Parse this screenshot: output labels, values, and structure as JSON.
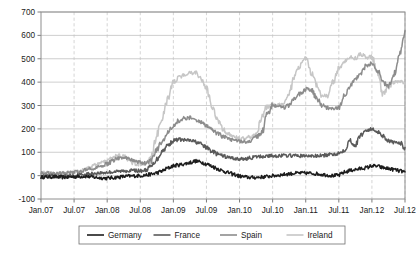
{
  "chart_data": {
    "type": "line",
    "title": "",
    "subtitle": "",
    "xlabel": "",
    "ylabel": "",
    "ylim": [
      -100,
      700
    ],
    "ytick_step": 100,
    "yticks": [
      "700",
      "600",
      "500",
      "400",
      "300",
      "200",
      "100",
      "0",
      "-100"
    ],
    "ytick_values": [
      700,
      600,
      500,
      400,
      300,
      200,
      100,
      0,
      -100
    ],
    "xticks": [
      "Jan.07",
      "Jul.07",
      "Jan.08",
      "Jul.08",
      "Jan.09",
      "Jul.09",
      "Jan.10",
      "Jul.10",
      "Jan.11",
      "Jul.11",
      "Jan.12",
      "Jul.12"
    ],
    "xtick_values": [
      0,
      6,
      12,
      18,
      24,
      30,
      36,
      42,
      48,
      54,
      60,
      66
    ],
    "xlim": [
      0,
      66
    ],
    "x_unit": "months since Jan 2007",
    "grid": {
      "horizontal": true,
      "vertical": true,
      "vertical_style": "dashed"
    },
    "legend": {
      "position": "bottom-center",
      "entries": [
        "Germany",
        "France",
        "Spain",
        "Ireland"
      ]
    },
    "colors": {
      "Germany": "#1d1d1d",
      "France": "#5a5a5a",
      "Spain": "#8c8c8c",
      "Ireland": "#c6c6c6",
      "grid_horizontal": "#b9b9b9",
      "grid_vertical": "#c3c3c3",
      "frame": "#8e8e8e",
      "background": "#ffffff",
      "text": "#1a1a1a"
    },
    "series": [
      {
        "name": "Germany",
        "color": "#1d1d1d",
        "width": 1.5,
        "x": [
          0,
          1,
          2,
          3,
          4,
          5,
          6,
          7,
          8,
          9,
          10,
          11,
          12,
          13,
          14,
          15,
          16,
          17,
          18,
          19,
          20,
          21,
          22,
          23,
          24,
          25,
          26,
          27,
          28,
          29,
          30,
          31,
          32,
          33,
          34,
          35,
          36,
          37,
          38,
          39,
          40,
          41,
          42,
          43,
          44,
          45,
          46,
          47,
          48,
          49,
          50,
          51,
          52,
          53,
          54,
          55,
          56,
          57,
          58,
          59,
          60,
          61,
          62,
          63,
          64,
          65,
          66
        ],
        "values": [
          -6,
          -6,
          -5,
          -6,
          -7,
          -6,
          -5,
          -4,
          -3,
          -5,
          -8,
          -10,
          -11,
          -9,
          -7,
          -4,
          -2,
          -1,
          0,
          2,
          6,
          12,
          20,
          32,
          42,
          46,
          50,
          56,
          62,
          58,
          50,
          40,
          30,
          20,
          12,
          5,
          -2,
          -6,
          -8,
          -8,
          -6,
          -4,
          -1,
          2,
          5,
          8,
          10,
          11,
          11,
          10,
          8,
          5,
          2,
          0,
          2,
          14,
          22,
          26,
          30,
          34,
          42,
          40,
          34,
          30,
          26,
          20,
          16
        ]
      },
      {
        "name": "France",
        "color": "#5a5a5a",
        "width": 1.5,
        "x": [
          0,
          1,
          2,
          3,
          4,
          5,
          6,
          7,
          8,
          9,
          10,
          11,
          12,
          13,
          14,
          15,
          16,
          17,
          18,
          19,
          20,
          21,
          22,
          23,
          24,
          25,
          26,
          27,
          28,
          29,
          30,
          31,
          32,
          33,
          34,
          35,
          36,
          37,
          38,
          39,
          40,
          41,
          42,
          43,
          44,
          45,
          46,
          47,
          48,
          49,
          50,
          51,
          52,
          53,
          54,
          55,
          56,
          57,
          58,
          59,
          60,
          61,
          62,
          63,
          64,
          65,
          66
        ],
        "values": [
          -4,
          -3,
          -2,
          -3,
          -4,
          -2,
          0,
          3,
          6,
          8,
          10,
          12,
          14,
          16,
          18,
          20,
          22,
          22,
          20,
          24,
          40,
          70,
          105,
          130,
          150,
          155,
          152,
          150,
          145,
          135,
          120,
          105,
          92,
          84,
          78,
          74,
          70,
          72,
          76,
          80,
          82,
          84,
          85,
          85,
          86,
          86,
          85,
          85,
          84,
          84,
          84,
          86,
          88,
          92,
          96,
          110,
          150,
          130,
          175,
          195,
          198,
          190,
          170,
          150,
          140,
          142,
          120
        ]
      },
      {
        "name": "Spain",
        "color": "#8c8c8c",
        "width": 1.5,
        "x": [
          0,
          1,
          2,
          3,
          4,
          5,
          6,
          7,
          8,
          9,
          10,
          11,
          12,
          13,
          14,
          15,
          16,
          17,
          18,
          19,
          20,
          21,
          22,
          23,
          24,
          25,
          26,
          27,
          28,
          29,
          30,
          31,
          32,
          33,
          34,
          35,
          36,
          37,
          38,
          39,
          40,
          41,
          42,
          43,
          44,
          45,
          46,
          47,
          48,
          49,
          50,
          51,
          52,
          53,
          54,
          55,
          56,
          57,
          58,
          59,
          60,
          61,
          62,
          63,
          64,
          65,
          66
        ],
        "values": [
          10,
          10,
          9,
          8,
          10,
          12,
          14,
          18,
          24,
          30,
          36,
          42,
          50,
          62,
          74,
          80,
          70,
          62,
          56,
          52,
          64,
          110,
          150,
          185,
          215,
          235,
          245,
          247,
          240,
          228,
          212,
          195,
          180,
          168,
          158,
          150,
          146,
          144,
          148,
          165,
          180,
          260,
          300,
          298,
          292,
          300,
          330,
          350,
          370,
          365,
          330,
          300,
          290,
          288,
          292,
          340,
          380,
          410,
          440,
          470,
          482,
          450,
          400,
          380,
          430,
          520,
          620
        ]
      },
      {
        "name": "Ireland",
        "color": "#c6c6c6",
        "width": 1.5,
        "x": [
          0,
          1,
          2,
          3,
          4,
          5,
          6,
          7,
          8,
          9,
          10,
          11,
          12,
          13,
          14,
          15,
          16,
          17,
          18,
          19,
          20,
          21,
          22,
          23,
          24,
          25,
          26,
          27,
          28,
          29,
          30,
          31,
          32,
          33,
          34,
          35,
          36,
          37,
          38,
          39,
          40,
          41,
          42,
          43,
          44,
          45,
          46,
          47,
          48,
          49,
          50,
          51,
          52,
          53,
          54,
          55,
          56,
          57,
          58,
          59,
          60,
          61,
          62,
          63,
          64,
          65,
          66
        ],
        "values": [
          12,
          12,
          11,
          10,
          10,
          12,
          14,
          18,
          26,
          36,
          48,
          58,
          68,
          80,
          86,
          82,
          62,
          50,
          48,
          52,
          80,
          175,
          250,
          330,
          400,
          420,
          430,
          438,
          440,
          420,
          370,
          300,
          240,
          200,
          178,
          168,
          160,
          158,
          166,
          175,
          250,
          295,
          305,
          300,
          310,
          350,
          430,
          470,
          510,
          440,
          390,
          340,
          345,
          400,
          460,
          490,
          510,
          500,
          520,
          505,
          510,
          440,
          350,
          380,
          400,
          400,
          400
        ]
      }
    ]
  },
  "legend": {
    "items": [
      {
        "label": "Germany",
        "color": "#1d1d1d"
      },
      {
        "label": "France",
        "color": "#5a5a5a"
      },
      {
        "label": "Spain",
        "color": "#8c8c8c"
      },
      {
        "label": "Ireland",
        "color": "#c6c6c6"
      }
    ]
  }
}
